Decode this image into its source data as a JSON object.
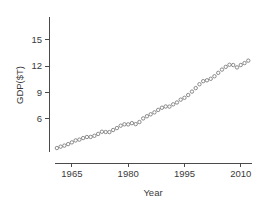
{
  "chart_data": {
    "type": "scatter",
    "title": "",
    "subtitle": "",
    "xlabel": "Year",
    "ylabel": "GDP($T)",
    "xlim": [
      1960.5,
      2013.0
    ],
    "ylim": [
      2.2,
      17.6
    ],
    "grid": false,
    "legend": null,
    "marker": "open-circle",
    "marker_color": "#777777",
    "xticks": [
      1965,
      1980,
      1995,
      2010
    ],
    "xtick_labels": [
      "1965",
      "1980",
      "1995",
      "2010"
    ],
    "yticks": [
      6,
      9,
      12,
      15
    ],
    "ytick_labels": [
      "6",
      "9",
      "12",
      "15"
    ],
    "x": [
      1961,
      1962,
      1963,
      1964,
      1965,
      1966,
      1967,
      1968,
      1969,
      1970,
      1971,
      1972,
      1973,
      1974,
      1975,
      1976,
      1977,
      1978,
      1979,
      1980,
      1981,
      1982,
      1983,
      1984,
      1985,
      1986,
      1987,
      1988,
      1989,
      1990,
      1991,
      1992,
      1993,
      1994,
      1995,
      1996,
      1997,
      1998,
      1999,
      2000,
      1901,
      2002,
      2003,
      2004,
      2005,
      2006,
      2007,
      2008,
      2009,
      2010,
      2011,
      2012
    ],
    "values": [
      2.65,
      2.81,
      2.93,
      3.1,
      3.3,
      3.52,
      3.61,
      3.79,
      3.91,
      3.92,
      4.05,
      4.26,
      4.51,
      4.48,
      4.47,
      4.71,
      4.93,
      5.2,
      5.36,
      5.35,
      5.49,
      5.38,
      5.62,
      6.03,
      6.28,
      6.5,
      6.72,
      7.0,
      7.25,
      7.39,
      7.38,
      7.64,
      7.85,
      8.17,
      8.38,
      8.7,
      9.09,
      9.49,
      9.93,
      10.28,
      10.38,
      10.55,
      10.84,
      11.23,
      11.6,
      11.91,
      12.15,
      12.12,
      11.85,
      12.12,
      12.34,
      12.62
    ],
    "series": [
      {
        "name": "GDP",
        "units": "trillions of dollars",
        "points": [
          {
            "year": 1961,
            "gdp": 2.65
          },
          {
            "year": 1962,
            "gdp": 2.81
          },
          {
            "year": 1963,
            "gdp": 2.93
          },
          {
            "year": 1964,
            "gdp": 3.1
          },
          {
            "year": 1965,
            "gdp": 3.3
          },
          {
            "year": 1966,
            "gdp": 3.52
          },
          {
            "year": 1967,
            "gdp": 3.61
          },
          {
            "year": 1968,
            "gdp": 3.79
          },
          {
            "year": 1969,
            "gdp": 3.91
          },
          {
            "year": 1970,
            "gdp": 3.92
          },
          {
            "year": 1971,
            "gdp": 4.05
          },
          {
            "year": 1972,
            "gdp": 4.26
          },
          {
            "year": 1973,
            "gdp": 4.51
          },
          {
            "year": 1974,
            "gdp": 4.48
          },
          {
            "year": 1975,
            "gdp": 4.47
          },
          {
            "year": 1976,
            "gdp": 4.71
          },
          {
            "year": 1977,
            "gdp": 4.93
          },
          {
            "year": 1978,
            "gdp": 5.2
          },
          {
            "year": 1979,
            "gdp": 5.36
          },
          {
            "year": 1980,
            "gdp": 5.35
          },
          {
            "year": 1981,
            "gdp": 5.49
          },
          {
            "year": 1982,
            "gdp": 5.38
          },
          {
            "year": 1983,
            "gdp": 5.62
          },
          {
            "year": 1984,
            "gdp": 6.03
          },
          {
            "year": 1985,
            "gdp": 6.28
          },
          {
            "year": 1986,
            "gdp": 6.5
          },
          {
            "year": 1987,
            "gdp": 6.72
          },
          {
            "year": 1988,
            "gdp": 7.0
          },
          {
            "year": 1989,
            "gdp": 7.25
          },
          {
            "year": 1990,
            "gdp": 7.39
          },
          {
            "year": 1991,
            "gdp": 7.38
          },
          {
            "year": 1992,
            "gdp": 7.64
          },
          {
            "year": 1993,
            "gdp": 7.85
          },
          {
            "year": 1994,
            "gdp": 8.17
          },
          {
            "year": 1995,
            "gdp": 8.38
          },
          {
            "year": 1996,
            "gdp": 8.7
          },
          {
            "year": 1997,
            "gdp": 9.09
          },
          {
            "year": 1998,
            "gdp": 9.49
          },
          {
            "year": 1999,
            "gdp": 9.93
          },
          {
            "year": 2000,
            "gdp": 10.28
          },
          {
            "year": 2001,
            "gdp": 10.38
          },
          {
            "year": 2002,
            "gdp": 10.55
          },
          {
            "year": 2003,
            "gdp": 10.84
          },
          {
            "year": 2004,
            "gdp": 11.23
          },
          {
            "year": 2005,
            "gdp": 11.6
          },
          {
            "year": 2006,
            "gdp": 11.91
          },
          {
            "year": 2007,
            "gdp": 12.15
          },
          {
            "year": 2008,
            "gdp": 12.12
          },
          {
            "year": 2009,
            "gdp": 11.85
          },
          {
            "year": 2010,
            "gdp": 12.12
          },
          {
            "year": 2011,
            "gdp": 12.34
          },
          {
            "year": 2012,
            "gdp": 12.62
          }
        ]
      }
    ]
  }
}
